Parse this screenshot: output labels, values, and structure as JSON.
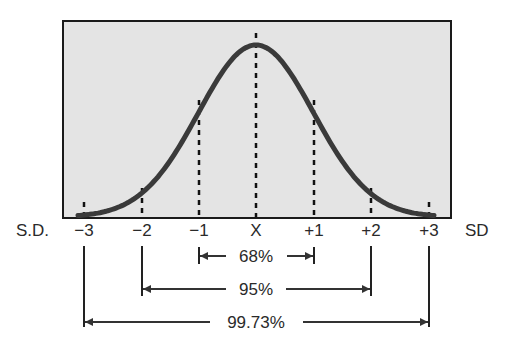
{
  "chart_data": {
    "type": "area",
    "title": "",
    "xlabel_left": "S.D.",
    "xlabel_right": "SD",
    "x_ticks": [
      "−3",
      "−2",
      "−1",
      "X",
      "+1",
      "+2",
      "+3"
    ],
    "x_values": [
      -3,
      -2,
      -1,
      0,
      1,
      2,
      3
    ],
    "grid": false,
    "intervals": [
      {
        "range": [
          -1,
          1
        ],
        "label": "68%",
        "value": 68
      },
      {
        "range": [
          -2,
          2
        ],
        "label": "95%",
        "value": 95
      },
      {
        "range": [
          -3,
          3
        ],
        "label": "99.73%",
        "value": 99.73
      }
    ],
    "colors": {
      "plot_bg": "#e4e4e4",
      "curve": "#3a3a3a",
      "border": "#1a1a1a"
    }
  },
  "axis": {
    "left_label": "S.D.",
    "right_label": "SD",
    "ticks": [
      "−3",
      "−2",
      "−1",
      "X",
      "+1",
      "+2",
      "+3"
    ]
  },
  "intervals": {
    "one_sd": "68%",
    "two_sd": "95%",
    "three_sd": "99.73%"
  }
}
